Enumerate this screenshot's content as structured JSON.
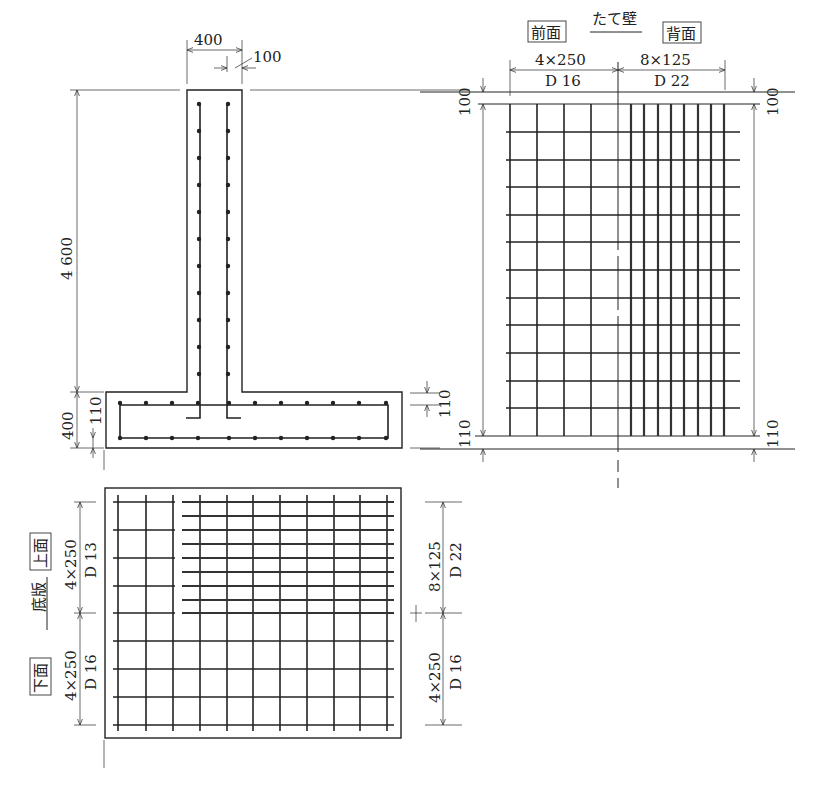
{
  "section": {
    "wall_width": "400",
    "cover": "100",
    "wall_height": "4 600",
    "slab_thickness": "400",
    "slab_cover_left": "110",
    "slab_cover_right": "110"
  },
  "wall": {
    "title": "たて壁",
    "front_label": "前面",
    "back_label": "背面",
    "front_spacing": "4×250",
    "front_bar": "D 16",
    "back_spacing": "8×125",
    "back_bar": "D 22",
    "top_cover_left": "100",
    "top_cover_right": "100",
    "bottom_cover_left": "110",
    "bottom_cover_right": "110"
  },
  "slab": {
    "title": "底版",
    "top_label": "上面",
    "bottom_label": "下面",
    "top_spacing": "4×250",
    "top_bar": "D 13",
    "bottom_spacing": "4×250",
    "bottom_bar": "D 16",
    "right_top_spacing": "8×125",
    "right_top_bar": "D 22",
    "right_bottom_spacing": "4×250",
    "right_bottom_bar": "D 16"
  }
}
